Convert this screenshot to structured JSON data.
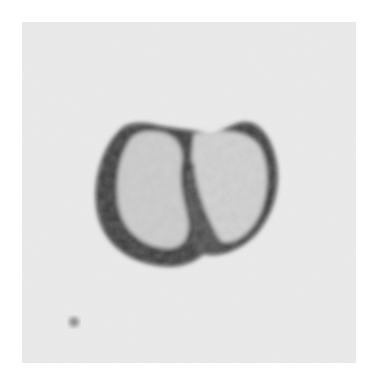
{
  "image": {
    "subject": "micrograph of a two-lobed cell",
    "background_color": "#ffffff",
    "field_color": "#ececec",
    "cell_rim_color": "#3a3a3a",
    "cell_interior_color": "#c8c8c8",
    "particle_color": "#9a9a9a"
  }
}
